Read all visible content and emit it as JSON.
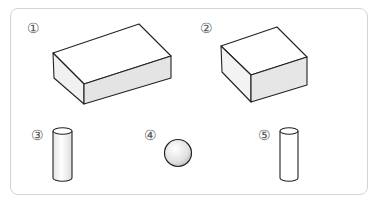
{
  "figure": {
    "items": [
      {
        "label": "①",
        "shape": "rectangular-prism (wide, flat)"
      },
      {
        "label": "②",
        "shape": "rectangular-prism (cube-like)"
      },
      {
        "label": "③",
        "shape": "cylinder"
      },
      {
        "label": "④",
        "shape": "sphere"
      },
      {
        "label": "⑤",
        "shape": "cylinder"
      }
    ]
  },
  "colors": {
    "frame": "#d4d4d4",
    "stroke": "#222222",
    "face_light": "#ffffff",
    "face_shade": "#e6e6e6",
    "label": "#555555"
  }
}
